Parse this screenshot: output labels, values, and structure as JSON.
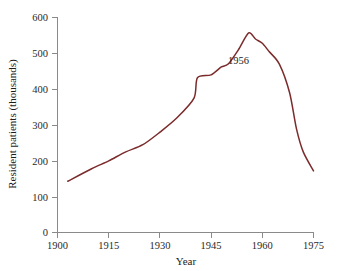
{
  "chart_data": {
    "type": "line",
    "title": "",
    "xlabel": "Year",
    "ylabel": "Resident patients (thousands)",
    "xlim": [
      1900,
      1975
    ],
    "ylim": [
      0,
      600
    ],
    "xticks": [
      1900,
      1915,
      1930,
      1945,
      1960,
      1975
    ],
    "xtick_labels": [
      "1900",
      "1915",
      "1930",
      "1945",
      "1960",
      "1975"
    ],
    "yticks": [
      0,
      100,
      200,
      300,
      400,
      500,
      600
    ],
    "ytick_labels": [
      "0",
      "100",
      "200",
      "300",
      "400",
      "500",
      "600"
    ],
    "grid": false,
    "legend": false,
    "line_color": "#7B2B2B",
    "series": [
      {
        "name": "Resident patients",
        "x": [
          1903,
          1910,
          1915,
          1920,
          1925,
          1930,
          1935,
          1940,
          1941,
          1945,
          1948,
          1950,
          1953,
          1956,
          1958,
          1960,
          1962,
          1965,
          1968,
          1970,
          1972,
          1975
        ],
        "values": [
          143,
          178,
          200,
          225,
          245,
          280,
          320,
          375,
          432,
          440,
          462,
          470,
          510,
          557,
          540,
          528,
          505,
          470,
          390,
          290,
          225,
          172
        ]
      }
    ],
    "annotations": [
      {
        "text": "1956",
        "x": 1953,
        "y": 470
      }
    ]
  }
}
